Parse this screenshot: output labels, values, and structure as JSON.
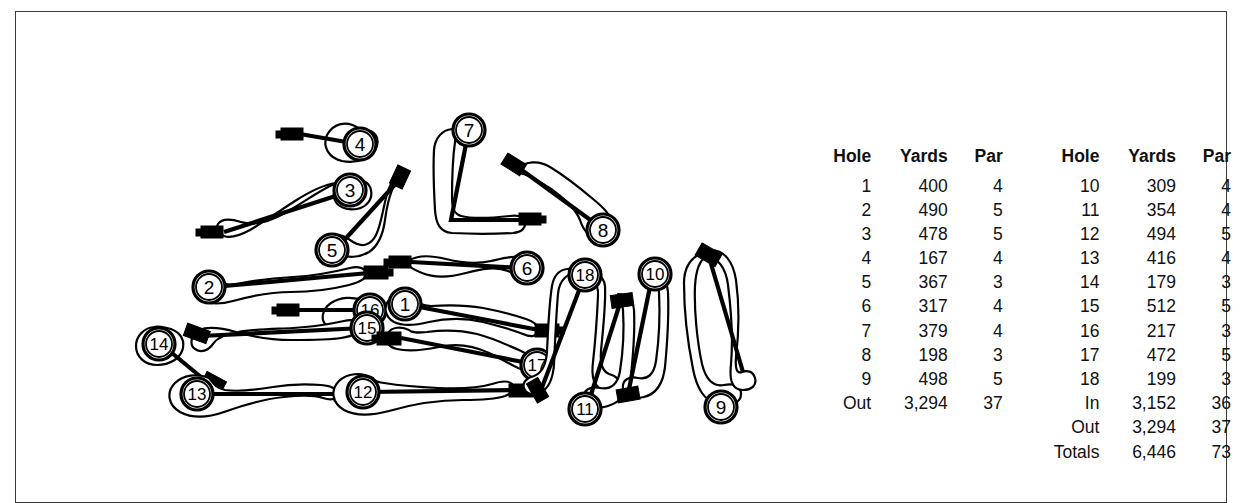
{
  "figure": {
    "kind": "golf-course-layout-with-scorecard",
    "border_color": "#3a3a3a",
    "ink_color": "#000000",
    "background": "#ffffff"
  },
  "scorecard": {
    "front": {
      "headers": {
        "hole": "Hole",
        "yards": "Yards",
        "par": "Par"
      },
      "rows": [
        {
          "hole": "1",
          "yards": "400",
          "par": "4"
        },
        {
          "hole": "2",
          "yards": "490",
          "par": "5"
        },
        {
          "hole": "3",
          "yards": "478",
          "par": "5"
        },
        {
          "hole": "4",
          "yards": "167",
          "par": "4"
        },
        {
          "hole": "5",
          "yards": "367",
          "par": "3"
        },
        {
          "hole": "6",
          "yards": "317",
          "par": "4"
        },
        {
          "hole": "7",
          "yards": "379",
          "par": "4"
        },
        {
          "hole": "8",
          "yards": "198",
          "par": "3"
        },
        {
          "hole": "9",
          "yards": "498",
          "par": "5"
        }
      ],
      "summary": [
        {
          "label": "Out",
          "yards": "3,294",
          "par": "37"
        }
      ]
    },
    "back": {
      "headers": {
        "hole": "Hole",
        "yards": "Yards",
        "par": "Par"
      },
      "rows": [
        {
          "hole": "10",
          "yards": "309",
          "par": "4"
        },
        {
          "hole": "11",
          "yards": "354",
          "par": "4"
        },
        {
          "hole": "12",
          "yards": "494",
          "par": "5"
        },
        {
          "hole": "13",
          "yards": "416",
          "par": "4"
        },
        {
          "hole": "14",
          "yards": "179",
          "par": "3"
        },
        {
          "hole": "15",
          "yards": "512",
          "par": "5"
        },
        {
          "hole": "16",
          "yards": "217",
          "par": "3"
        },
        {
          "hole": "17",
          "yards": "472",
          "par": "5"
        },
        {
          "hole": "18",
          "yards": "199",
          "par": "3"
        }
      ],
      "summary": [
        {
          "label": "In",
          "yards": "3,152",
          "par": "36"
        },
        {
          "label": "Out",
          "yards": "3,294",
          "par": "37"
        },
        {
          "label": "Totals",
          "yards": "6,446",
          "par": "73"
        }
      ]
    }
  },
  "course_map": {
    "hole_labels": [
      "1",
      "2",
      "3",
      "4",
      "5",
      "6",
      "7",
      "8",
      "9",
      "10",
      "11",
      "12",
      "13",
      "14",
      "15",
      "16",
      "17",
      "18"
    ],
    "green_numbers": {
      "h1": "1",
      "h2": "2",
      "h3": "3",
      "h4": "4",
      "h5": "5",
      "h6": "6",
      "h7": "7",
      "h8": "8",
      "h9": "9",
      "h10": "10",
      "h11": "11",
      "h12": "12",
      "h13": "13",
      "h14": "14",
      "h15": "15",
      "h16": "16",
      "h17": "17",
      "h18": "18"
    }
  }
}
